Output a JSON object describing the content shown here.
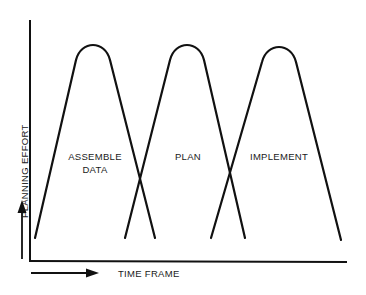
{
  "diagram": {
    "type": "overlapping-phase-curves",
    "y_axis": {
      "label": "PLANNING EFFORT",
      "arrow": "up"
    },
    "x_axis": {
      "label": "TIME FRAME",
      "arrow": "right"
    },
    "phases": [
      {
        "label_line1": "ASSEMBLE",
        "label_line2": "DATA"
      },
      {
        "label_line1": "PLAN",
        "label_line2": ""
      },
      {
        "label_line1": "IMPLEMENT",
        "label_line2": ""
      }
    ],
    "colors": {
      "stroke": "#111111",
      "background": "#ffffff",
      "text": "#1a1a1a"
    }
  }
}
